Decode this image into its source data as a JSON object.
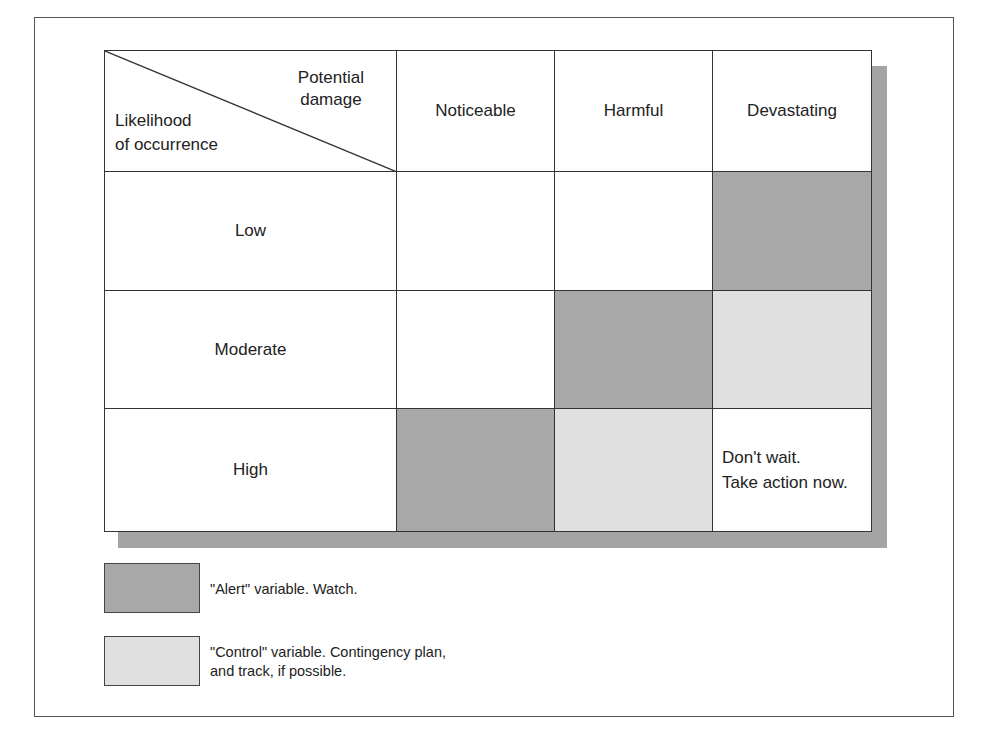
{
  "corner": {
    "top_line1": "Potential",
    "top_line2": "damage",
    "bottom_line1": "Likelihood",
    "bottom_line2": "of occurrence"
  },
  "columns": [
    "Noticeable",
    "Harmful",
    "Devastating"
  ],
  "rows": [
    {
      "label": "Low",
      "cells": [
        "none",
        "none",
        "alert"
      ]
    },
    {
      "label": "Moderate",
      "cells": [
        "none",
        "alert",
        "control"
      ]
    },
    {
      "label": "High",
      "cells": [
        "alert",
        "control",
        "note"
      ]
    }
  ],
  "note": {
    "line1": "Don't wait.",
    "line2": "Take action now."
  },
  "legend": [
    {
      "type": "alert",
      "color": "#a8a8a8",
      "line1": "\"Alert\" variable.  Watch.",
      "line2": ""
    },
    {
      "type": "control",
      "color": "#e0e0e0",
      "line1": "\"Control\" variable.  Contingency plan,",
      "line2": "and track, if possible."
    }
  ],
  "colors": {
    "alert": "#a8a8a8",
    "control": "#e0e0e0",
    "shadow": "#a4a4a4",
    "border": "#333333"
  }
}
